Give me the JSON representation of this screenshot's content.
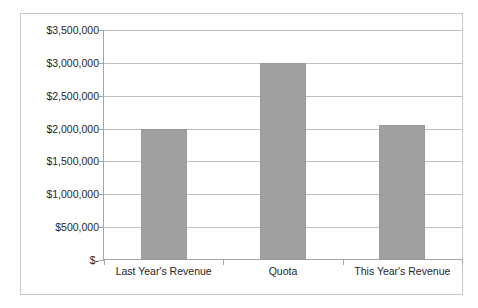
{
  "chart_data": {
    "type": "bar",
    "title": "",
    "subtitle": "",
    "xlabel": "",
    "ylabel": "",
    "categories": [
      "Last Year's Revenue",
      "Quota",
      "This Year's Revenue"
    ],
    "values": [
      2000000,
      3000000,
      2060000
    ],
    "series": [
      {
        "name": "",
        "values": [
          2000000,
          3000000,
          2060000
        ]
      }
    ],
    "ylim": [
      0,
      3500000
    ],
    "ytick_step": 500000,
    "ytick_labels": [
      "$3,500,000",
      "$3,000,000",
      "$2,500,000",
      "$2,000,000",
      "$1,500,000",
      "$1,000,000",
      "$500,000",
      "$-"
    ],
    "ytick_values": [
      3500000,
      3000000,
      2500000,
      2000000,
      1500000,
      1000000,
      500000,
      0
    ],
    "grid": true,
    "grid_axis": "y",
    "legend": false,
    "legend_position": "none",
    "annotations": [],
    "colors": {
      "bar_fill": "#a0a0a0",
      "bar_border": "#9a9a9a",
      "gridline": "#bfbfbf",
      "axis_line": "#a6a6a6",
      "text": "#262626",
      "plot_background": "#ffffff",
      "frame_border": "#c8c8c8"
    }
  }
}
